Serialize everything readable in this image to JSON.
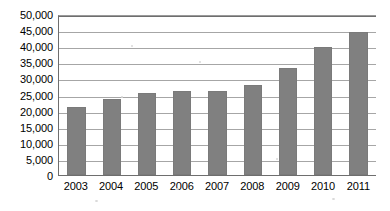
{
  "chart_data": {
    "type": "bar",
    "title": "",
    "subtitle": "",
    "xlabel": "",
    "ylabel": "",
    "categories": [
      "2003",
      "2004",
      "2005",
      "2006",
      "2007",
      "2008",
      "2009",
      "2010",
      "2011"
    ],
    "values": [
      21000,
      23600,
      25400,
      26200,
      26000,
      27800,
      33100,
      39800,
      44300
    ],
    "series": [
      {
        "name": "",
        "values": [
          21000,
          23600,
          25400,
          26200,
          26000,
          27800,
          33100,
          39800,
          44300
        ]
      }
    ],
    "ylim": [
      0,
      50000
    ],
    "ytick_step": 5000,
    "ytick_labels": [
      "50,000",
      "45,000",
      "40,000",
      "35,000",
      "30,000",
      "25,000",
      "20,000",
      "15,000",
      "10,000",
      "5,000",
      "0"
    ],
    "ytick_values": [
      50000,
      45000,
      40000,
      35000,
      30000,
      25000,
      20000,
      15000,
      10000,
      5000,
      0
    ],
    "grid": true,
    "grid_axis": "y",
    "legend": false,
    "legend_position": "none",
    "annotations": [],
    "colors": {
      "bar_fill": "#808080",
      "bar_stroke": "#7a7a7a",
      "gridline": "#a6a6a6",
      "axis": "#6e6e6e",
      "text": "#000000",
      "background": "#ffffff"
    }
  }
}
